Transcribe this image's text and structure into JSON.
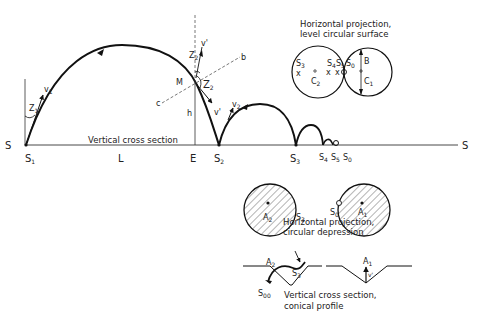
{
  "diagram": {
    "colors": {
      "line": "#111111",
      "dash": "#555555",
      "hatch": "#444444",
      "background": "#ffffff"
    },
    "vertical_section": {
      "caption": "Vertical cross section",
      "baseline_start_label": "S",
      "baseline_end_label": "S",
      "points": {
        "S1": {
          "label": "S",
          "sub": "1"
        },
        "L": {
          "label": "L"
        },
        "E": {
          "label": "E"
        },
        "S2": {
          "label": "S",
          "sub": "2"
        },
        "S3": {
          "label": "S",
          "sub": "3"
        },
        "S4": {
          "label": "S",
          "sub": "4"
        },
        "S5": {
          "label": "S",
          "sub": "5"
        },
        "S0": {
          "label": "S",
          "sub": "0"
        }
      },
      "vectors": {
        "v1": {
          "label": "v",
          "sub": "1"
        },
        "v2": {
          "label": "v",
          "sub": "2"
        },
        "v_prime_top": {
          "label": "v'"
        },
        "v_prime_bottom": {
          "label": "v'"
        }
      },
      "angles": {
        "Z1": {
          "label": "Z",
          "sub": "1"
        },
        "Z2_top": {
          "label": "Z",
          "sub": "2"
        },
        "Z2": {
          "label": "Z",
          "sub": "2"
        }
      },
      "other": {
        "M": "M",
        "h": "h",
        "b": "b",
        "c": "c"
      }
    },
    "level_surface": {
      "caption_line1": "Horizontal projection,",
      "caption_line2": "level circular surface",
      "labels": {
        "S3": {
          "label": "S",
          "sub": "3"
        },
        "S4": {
          "label": "S",
          "sub": "4"
        },
        "S5": {
          "label": "S",
          "sub": "5"
        },
        "S0": {
          "label": "S",
          "sub": "0"
        },
        "C2": {
          "label": "C",
          "sub": "2"
        },
        "C1": {
          "label": "C",
          "sub": "1"
        },
        "B": "B",
        "x": "x"
      }
    },
    "depression": {
      "caption_line1": "Horizontal projection,",
      "caption_line2": "circular depression",
      "labels": {
        "A2": {
          "label": "A",
          "sub": "2"
        },
        "S3": {
          "label": "S",
          "sub": "3"
        },
        "S0": {
          "label": "S",
          "sub": "0"
        },
        "A1": {
          "label": "A",
          "sub": "1"
        }
      }
    },
    "conical_profile": {
      "caption_line1": "Vertical cross section,",
      "caption_line2": "conical profile",
      "labels": {
        "A2": {
          "label": "A",
          "sub": "2"
        },
        "S3": {
          "label": "S",
          "sub": "3"
        },
        "S00": {
          "label": "S",
          "sub": "00"
        },
        "A1": {
          "label": "A",
          "sub": "1"
        },
        "v_prime": "v'"
      }
    }
  }
}
